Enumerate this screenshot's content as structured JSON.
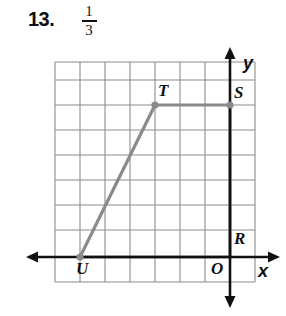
{
  "header": {
    "problem_number": "13.",
    "fraction": {
      "numerator": "1",
      "denominator": "3"
    }
  },
  "figure": {
    "name": "coordinate-grid-trapezoid",
    "colors": {
      "grid_line": "#8c8c8c",
      "shape_stroke": "#8a8a8a",
      "axis": "#111111",
      "background": "#ffffff"
    },
    "grid": {
      "left": 55,
      "top": 62,
      "right": 255,
      "bottom": 282,
      "cell": 25,
      "vertical_lines": [
        55,
        80,
        105,
        130,
        155,
        180,
        205,
        230,
        255
      ],
      "horizontal_lines": [
        80,
        105,
        130,
        155,
        180,
        205,
        230,
        257,
        282
      ],
      "extra_top_line": 62
    },
    "axes": {
      "x_axis": {
        "y": 257,
        "from_x": 34,
        "to_x": 272,
        "label": "x",
        "label_pos": {
          "x": 258,
          "y": 262
        },
        "arrow_left": true,
        "arrow_right": true
      },
      "y_axis": {
        "x": 230,
        "from_y": 55,
        "to_y": 300,
        "label": "y",
        "label_pos": {
          "x": 243,
          "y": 54
        },
        "arrow_up": true,
        "arrow_down": true
      },
      "origin_label": "O",
      "origin_label_pos": {
        "x": 211,
        "y": 260
      }
    },
    "shape": {
      "type": "trapezoid",
      "vertices": [
        {
          "label": "U",
          "x": 80,
          "y": 257,
          "label_pos": {
            "x": 76,
            "y": 260
          },
          "dot": true
        },
        {
          "label": "T",
          "x": 155,
          "y": 105,
          "label_pos": {
            "x": 158,
            "y": 82
          },
          "dot": true
        },
        {
          "label": "S",
          "x": 230,
          "y": 105,
          "label_pos": {
            "x": 234,
            "y": 84
          },
          "dot": true
        },
        {
          "label": "R",
          "x": 230,
          "y": 257,
          "label_pos": {
            "x": 234,
            "y": 230
          },
          "dot": false
        }
      ]
    }
  }
}
